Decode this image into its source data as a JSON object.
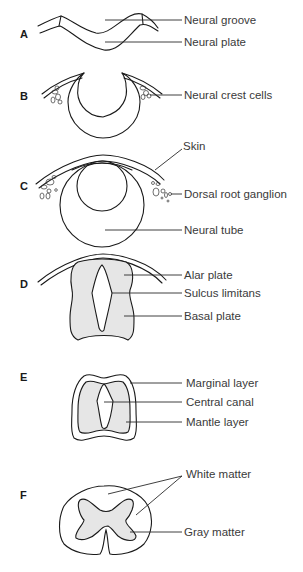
{
  "figure": {
    "panels": [
      {
        "id": "A",
        "letter": "A",
        "labels": [
          "Neural groove",
          "Neural plate"
        ]
      },
      {
        "id": "B",
        "letter": "B",
        "labels": [
          "Neural crest cells"
        ]
      },
      {
        "id": "C",
        "letter": "C",
        "labels": [
          "Skin",
          "Dorsal root ganglion",
          "Neural tube"
        ]
      },
      {
        "id": "D",
        "letter": "D",
        "labels": [
          "Alar plate",
          "Sulcus limitans",
          "Basal plate"
        ]
      },
      {
        "id": "E",
        "letter": "E",
        "labels": [
          "Marginal layer",
          "Central canal",
          "Mantle layer"
        ]
      },
      {
        "id": "F",
        "letter": "F",
        "labels": [
          "White matter",
          "Gray matter"
        ]
      }
    ]
  },
  "colors": {
    "line": "#1a1a1a",
    "gray_fill": "#e6e6e6",
    "label_text": "#3a3a3a",
    "background": "#ffffff"
  }
}
